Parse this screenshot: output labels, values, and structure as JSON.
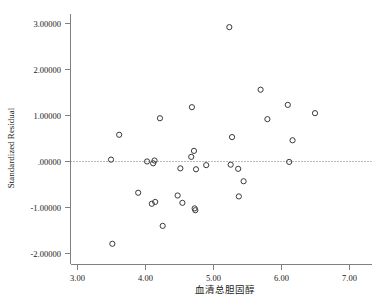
{
  "chart_data": {
    "type": "scatter",
    "title": "",
    "xlabel": "血清总胆固醇",
    "ylabel": "Standardized Residual",
    "xlim": [
      2.72,
      7.32
    ],
    "ylim": [
      -2.28,
      3.17
    ],
    "grid": false,
    "legend": null,
    "reference_line": {
      "orientation": "horizontal",
      "value": 0.0,
      "style": "dotted"
    },
    "xticks": [
      3.0,
      4.0,
      5.0,
      6.0,
      7.0
    ],
    "xtick_labels": [
      "3.00",
      "4.00",
      "5.00",
      "6.00",
      "7.00"
    ],
    "yticks": [
      3.0,
      2.0,
      1.0,
      0.0,
      -1.0,
      -2.0
    ],
    "ytick_labels": [
      "3.00000",
      "2.00000",
      "1.00000",
      ".00000",
      "-1.00000",
      "-2.00000"
    ],
    "marker": "open-circle",
    "marker_color": "#3a3a3a",
    "points": [
      {
        "x": 3.5,
        "y": 0.03
      },
      {
        "x": 3.52,
        "y": -1.8
      },
      {
        "x": 3.62,
        "y": 0.57
      },
      {
        "x": 3.9,
        "y": -0.69
      },
      {
        "x": 4.03,
        "y": -0.01
      },
      {
        "x": 4.1,
        "y": -0.93
      },
      {
        "x": 4.12,
        "y": -0.05
      },
      {
        "x": 4.14,
        "y": 0.01
      },
      {
        "x": 4.15,
        "y": -0.89
      },
      {
        "x": 4.22,
        "y": 0.93
      },
      {
        "x": 4.26,
        "y": -1.41
      },
      {
        "x": 4.48,
        "y": -0.75
      },
      {
        "x": 4.52,
        "y": -0.16
      },
      {
        "x": 4.55,
        "y": -0.91
      },
      {
        "x": 4.68,
        "y": 0.09
      },
      {
        "x": 4.69,
        "y": 1.17
      },
      {
        "x": 4.72,
        "y": 0.22
      },
      {
        "x": 4.73,
        "y": -1.03
      },
      {
        "x": 4.74,
        "y": -1.07
      },
      {
        "x": 4.75,
        "y": -0.18
      },
      {
        "x": 4.9,
        "y": -0.09
      },
      {
        "x": 5.24,
        "y": 2.91
      },
      {
        "x": 5.26,
        "y": -0.08
      },
      {
        "x": 5.28,
        "y": 0.52
      },
      {
        "x": 5.37,
        "y": -0.17
      },
      {
        "x": 5.38,
        "y": -0.77
      },
      {
        "x": 5.45,
        "y": -0.44
      },
      {
        "x": 5.7,
        "y": 1.55
      },
      {
        "x": 5.8,
        "y": 0.91
      },
      {
        "x": 6.1,
        "y": 1.22
      },
      {
        "x": 6.12,
        "y": -0.02
      },
      {
        "x": 6.17,
        "y": 0.45
      },
      {
        "x": 6.5,
        "y": 1.04
      }
    ]
  }
}
